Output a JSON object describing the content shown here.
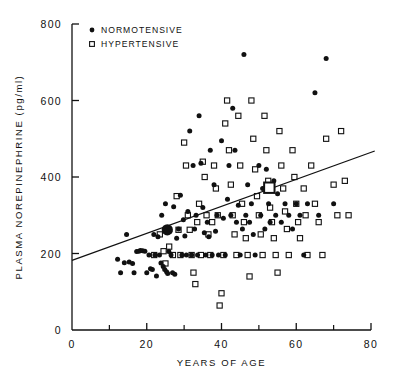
{
  "chart_data": {
    "type": "scatter",
    "title": "",
    "xlabel": "YEARS OF AGE",
    "ylabel": "PLASMA NOREPINEPHRINE (pg/ml)",
    "ylabel_main": "PLASMA  NOREPINEPHRINE",
    "ylabel_units": "(pg/ml)",
    "xlim": [
      0,
      80
    ],
    "ylim": [
      0,
      800
    ],
    "xticks": [
      0,
      20,
      40,
      60,
      80
    ],
    "xticks_minor": [
      10,
      30,
      50,
      70
    ],
    "yticks": [
      0,
      200,
      400,
      600,
      800
    ],
    "grid": false,
    "legend_position": "top-left",
    "legend": [
      {
        "label": "NORMOTENSIVE",
        "marker": "filled-circle"
      },
      {
        "label": "HYPERTENSIVE",
        "marker": "open-square"
      }
    ],
    "trend_line": {
      "label": "regression-line",
      "x0": 0,
      "y0": 182,
      "x1": 81,
      "y1": 468
    },
    "group_means": [
      {
        "name": "normotensive-mean",
        "marker": "large-filled-circle",
        "x": 25.5,
        "y": 262
      },
      {
        "name": "hypertensive-mean",
        "marker": "large-open-square",
        "x": 52.8,
        "y": 372
      }
    ],
    "series": [
      {
        "name": "NORMOTENSIVE",
        "marker": "filled-circle",
        "points": [
          [
            12.2,
            185
          ],
          [
            13.0,
            150
          ],
          [
            14.0,
            176
          ],
          [
            14.6,
            250
          ],
          [
            15.3,
            178
          ],
          [
            16.2,
            174
          ],
          [
            16.6,
            150
          ],
          [
            17.3,
            205
          ],
          [
            17.9,
            206
          ],
          [
            18.3,
            208
          ],
          [
            18.9,
            207
          ],
          [
            19.5,
            206
          ],
          [
            20.0,
            150
          ],
          [
            20.6,
            196
          ],
          [
            21.0,
            160
          ],
          [
            21.5,
            158
          ],
          [
            21.9,
            250
          ],
          [
            22.2,
            196
          ],
          [
            22.6,
            141
          ],
          [
            23.0,
            244
          ],
          [
            23.4,
            196
          ],
          [
            23.8,
            175
          ],
          [
            24.0,
            300
          ],
          [
            24.4,
            166
          ],
          [
            24.8,
            158
          ],
          [
            25.0,
            330
          ],
          [
            25.3,
            152
          ],
          [
            25.6,
            148
          ],
          [
            25.9,
            205
          ],
          [
            26.2,
            258
          ],
          [
            26.5,
            196
          ],
          [
            26.9,
            150
          ],
          [
            27.2,
            322
          ],
          [
            27.5,
            146
          ],
          [
            28.0,
            240
          ],
          [
            28.5,
            264
          ],
          [
            29.0,
            352
          ],
          [
            29.4,
            196
          ],
          [
            29.8,
            288
          ],
          [
            30.2,
            246
          ],
          [
            30.6,
            196
          ],
          [
            31.0,
            310
          ],
          [
            31.5,
            520
          ],
          [
            32.0,
            196
          ],
          [
            32.4,
            430
          ],
          [
            32.8,
            264
          ],
          [
            33.2,
            300
          ],
          [
            33.6,
            196
          ],
          [
            34.0,
            560
          ],
          [
            34.5,
            436
          ],
          [
            35.0,
            320
          ],
          [
            35.4,
            254
          ],
          [
            35.8,
            196
          ],
          [
            36.2,
            282
          ],
          [
            36.6,
            244
          ],
          [
            37.0,
            470
          ],
          [
            37.5,
            196
          ],
          [
            38.0,
            380
          ],
          [
            38.4,
            258
          ],
          [
            38.8,
            300
          ],
          [
            39.2,
            196
          ],
          [
            40.0,
            495
          ],
          [
            40.5,
            292
          ],
          [
            41.0,
            196
          ],
          [
            41.6,
            342
          ],
          [
            42.0,
            430
          ],
          [
            42.5,
            300
          ],
          [
            43.0,
            580
          ],
          [
            43.6,
            470
          ],
          [
            44.0,
            282
          ],
          [
            44.5,
            326
          ],
          [
            45.0,
            196
          ],
          [
            45.6,
            264
          ],
          [
            46.0,
            720
          ],
          [
            46.5,
            300
          ],
          [
            47.0,
            380
          ],
          [
            47.5,
            282
          ],
          [
            48.0,
            330
          ],
          [
            48.5,
            250
          ],
          [
            49.0,
            196
          ],
          [
            50.0,
            430
          ],
          [
            50.5,
            300
          ],
          [
            51.0,
            370
          ],
          [
            51.6,
            264
          ],
          [
            52.0,
            420
          ],
          [
            52.6,
            330
          ],
          [
            53.0,
            282
          ],
          [
            54.0,
            390
          ],
          [
            54.5,
            300
          ],
          [
            55.0,
            356
          ],
          [
            56.0,
            282
          ],
          [
            57.0,
            330
          ],
          [
            58.0,
            300
          ],
          [
            59.0,
            264
          ],
          [
            60.0,
            330
          ],
          [
            61.0,
            300
          ],
          [
            62.0,
            196
          ],
          [
            63.0,
            330
          ],
          [
            65.0,
            620
          ],
          [
            66.0,
            300
          ],
          [
            68.0,
            710
          ],
          [
            70.0,
            330
          ]
        ]
      },
      {
        "name": "HYPERTENSIVE",
        "marker": "open-square",
        "points": [
          [
            22.0,
            196
          ],
          [
            23.5,
            250
          ],
          [
            24.5,
            206
          ],
          [
            25.0,
            174
          ],
          [
            26.0,
            218
          ],
          [
            27.0,
            196
          ],
          [
            28.0,
            350
          ],
          [
            28.5,
            262
          ],
          [
            29.0,
            196
          ],
          [
            30.0,
            490
          ],
          [
            30.5,
            430
          ],
          [
            31.0,
            300
          ],
          [
            31.5,
            262
          ],
          [
            32.0,
            196
          ],
          [
            32.5,
            150
          ],
          [
            33.0,
            120
          ],
          [
            33.5,
            282
          ],
          [
            34.0,
            330
          ],
          [
            34.5,
            196
          ],
          [
            35.0,
            440
          ],
          [
            35.5,
            400
          ],
          [
            36.0,
            300
          ],
          [
            36.5,
            250
          ],
          [
            37.0,
            196
          ],
          [
            37.5,
            282
          ],
          [
            38.0,
            430
          ],
          [
            38.5,
            370
          ],
          [
            39.0,
            300
          ],
          [
            39.5,
            64
          ],
          [
            40.0,
            96
          ],
          [
            40.5,
            196
          ],
          [
            41.0,
            540
          ],
          [
            41.5,
            600
          ],
          [
            42.0,
            470
          ],
          [
            42.5,
            380
          ],
          [
            43.0,
            300
          ],
          [
            43.5,
            250
          ],
          [
            44.0,
            196
          ],
          [
            44.5,
            560
          ],
          [
            45.0,
            430
          ],
          [
            45.5,
            330
          ],
          [
            46.0,
            282
          ],
          [
            46.5,
            240
          ],
          [
            47.0,
            196
          ],
          [
            47.5,
            140
          ],
          [
            48.0,
            600
          ],
          [
            48.5,
            500
          ],
          [
            49.0,
            420
          ],
          [
            49.5,
            350
          ],
          [
            50.0,
            300
          ],
          [
            50.5,
            250
          ],
          [
            51.0,
            196
          ],
          [
            51.5,
            560
          ],
          [
            52.0,
            470
          ],
          [
            52.5,
            390
          ],
          [
            53.0,
            320
          ],
          [
            53.5,
            282
          ],
          [
            54.0,
            240
          ],
          [
            54.5,
            196
          ],
          [
            55.0,
            150
          ],
          [
            55.5,
            520
          ],
          [
            56.0,
            430
          ],
          [
            56.5,
            370
          ],
          [
            57.0,
            310
          ],
          [
            57.5,
            264
          ],
          [
            58.0,
            196
          ],
          [
            59.0,
            470
          ],
          [
            59.5,
            400
          ],
          [
            60.0,
            330
          ],
          [
            60.5,
            282
          ],
          [
            61.0,
            240
          ],
          [
            62.0,
            370
          ],
          [
            62.5,
            300
          ],
          [
            63.0,
            196
          ],
          [
            64.0,
            430
          ],
          [
            65.0,
            330
          ],
          [
            66.0,
            282
          ],
          [
            67.0,
            196
          ],
          [
            68.0,
            500
          ],
          [
            70.0,
            380
          ],
          [
            71.0,
            300
          ],
          [
            72.0,
            520
          ],
          [
            73.0,
            390
          ],
          [
            74.0,
            300
          ]
        ]
      }
    ]
  }
}
